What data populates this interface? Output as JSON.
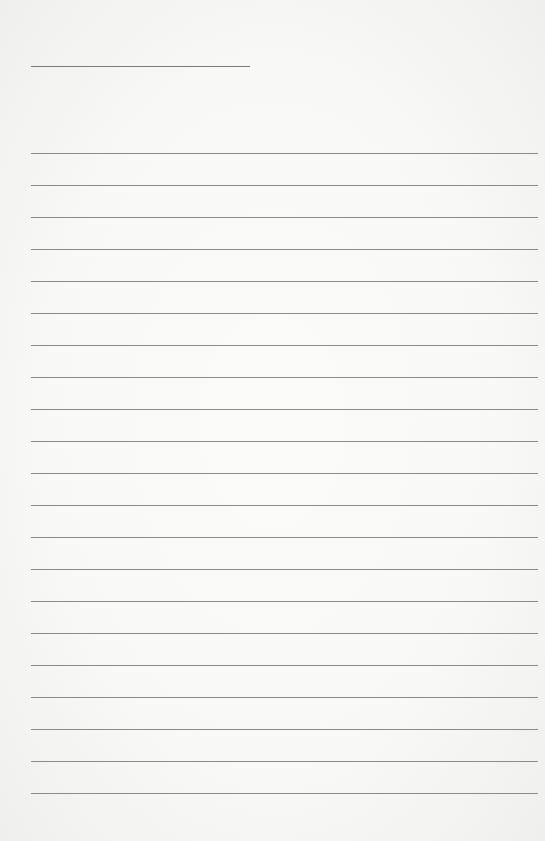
{
  "page": {
    "type": "lined-paper",
    "background_color": "#f8f8f7",
    "line_color": "#8a8a8a",
    "header_line": {
      "x": 31,
      "y": 66,
      "width": 219
    },
    "rules": {
      "count": 21,
      "first_y": 153,
      "spacing": 32,
      "x": 31,
      "width": 507
    }
  }
}
